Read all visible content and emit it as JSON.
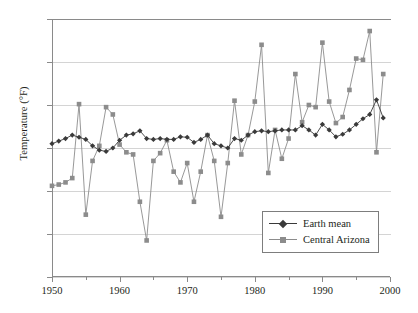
{
  "chart_data": {
    "type": "line",
    "title": "",
    "xlabel": "",
    "ylabel": "Temperature (°F)",
    "xlim": [
      1950,
      2000
    ],
    "ylim": [
      -3,
      3
    ],
    "grid": true,
    "legend_position": "bottom-right",
    "x_ticks": [
      1950,
      1960,
      1970,
      1980,
      1990,
      2000
    ],
    "x_minor_ticks": [
      1955,
      1965,
      1975,
      1985,
      1995
    ],
    "y_ticks": [
      3,
      2,
      1,
      0,
      -1,
      -2,
      -3
    ],
    "x": [
      1950,
      1951,
      1952,
      1953,
      1954,
      1955,
      1956,
      1957,
      1958,
      1959,
      1960,
      1961,
      1962,
      1963,
      1964,
      1965,
      1966,
      1967,
      1968,
      1969,
      1970,
      1971,
      1972,
      1973,
      1974,
      1975,
      1976,
      1977,
      1978,
      1979,
      1980,
      1981,
      1982,
      1983,
      1984,
      1985,
      1986,
      1987,
      1988,
      1989,
      1990,
      1991,
      1992,
      1993,
      1994,
      1995,
      1996,
      1997,
      1998,
      1999
    ],
    "series": [
      {
        "name": "Earth mean",
        "color": "#3a3a3a",
        "marker": "diamond",
        "values": [
          0.1,
          0.16,
          0.22,
          0.3,
          0.25,
          0.2,
          0.05,
          -0.05,
          -0.08,
          0.0,
          0.18,
          0.3,
          0.33,
          0.4,
          0.22,
          0.2,
          0.22,
          0.2,
          0.2,
          0.26,
          0.25,
          0.13,
          0.2,
          0.3,
          0.1,
          0.05,
          0.0,
          0.22,
          0.18,
          0.3,
          0.38,
          0.4,
          0.38,
          0.4,
          0.42,
          0.42,
          0.42,
          0.52,
          0.42,
          0.3,
          0.55,
          0.42,
          0.26,
          0.32,
          0.42,
          0.55,
          0.68,
          0.78,
          1.12,
          0.7
        ]
      },
      {
        "name": "Central Arizona",
        "color": "#8c8c8c",
        "marker": "square",
        "values": [
          -0.88,
          -0.85,
          -0.8,
          -0.7,
          1.02,
          -1.55,
          -0.3,
          0.05,
          0.95,
          0.78,
          0.08,
          -0.1,
          -0.15,
          -1.25,
          -2.15,
          -0.3,
          -0.12,
          0.18,
          -0.55,
          -0.8,
          -0.35,
          -1.25,
          -0.55,
          0.3,
          -0.3,
          -1.6,
          -0.35,
          1.1,
          -0.15,
          0.3,
          1.08,
          2.4,
          -0.58,
          0.42,
          -0.25,
          0.22,
          1.72,
          0.6,
          1.0,
          0.95,
          2.45,
          1.08,
          0.58,
          0.72,
          1.35,
          2.08,
          2.05,
          2.72,
          -0.1,
          1.72
        ]
      }
    ]
  },
  "legend": {
    "items": [
      {
        "label": "Earth mean"
      },
      {
        "label": "Central Arizona"
      }
    ]
  },
  "axis_labels": {
    "y_title": "Temperature (°F)",
    "y_ticks": [
      "3",
      "2",
      "1",
      "0",
      "−1",
      "−2",
      "−3"
    ],
    "x_ticks": [
      "1950",
      "1960",
      "1970",
      "1980",
      "1990",
      "2000"
    ]
  },
  "colors": {
    "earth_mean": "#3a3a3a",
    "central_arizona": "#8c8c8c",
    "grid": "#d4d4d4",
    "axis": "#8a8a8a",
    "background": "#ffffff"
  }
}
